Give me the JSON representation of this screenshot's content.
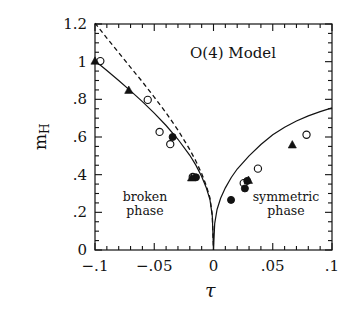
{
  "figure": {
    "title": "O(4) Model",
    "y_axis_label_main": "m",
    "y_axis_label_sub": "H",
    "x_axis_label": "τ",
    "annotations": {
      "left_line1": "broken",
      "left_line2": "phase",
      "right_line1": "symmetric",
      "right_line2": "phase"
    }
  },
  "chart_data": {
    "type": "scatter",
    "title": "O(4) Model",
    "xlabel": "τ",
    "ylabel": "m_H",
    "xlim": [
      -0.1,
      0.1
    ],
    "ylim": [
      0,
      1.2
    ],
    "grid": false,
    "legend": "none",
    "x_major_ticks": [
      -0.1,
      -0.05,
      0,
      0.05,
      0.1
    ],
    "x_major_tick_labels": [
      "−.1",
      "−.05",
      "0",
      ".05",
      ".1"
    ],
    "x_minor_step": 0.01,
    "y_major_ticks": [
      0,
      0.2,
      0.4,
      0.6,
      0.8,
      1.0,
      1.2
    ],
    "y_major_tick_labels": [
      "0",
      ".2",
      ".4",
      ".6",
      ".8",
      "1",
      "1.2"
    ],
    "y_minor_step": 0.05,
    "annotations": [
      {
        "text": "O(4) Model",
        "x": 0.012,
        "y": 1.04
      },
      {
        "text": "broken phase",
        "x": -0.058,
        "y": 0.235
      },
      {
        "text": "symmetric phase",
        "x": 0.055,
        "y": 0.235
      }
    ],
    "series": [
      {
        "name": "solid-curve",
        "style": "line-solid",
        "comment": "V-shaped fit passing through origin; broken branch left, symmetric branch right",
        "x": [
          -0.1,
          -0.09,
          -0.08,
          -0.07,
          -0.06,
          -0.05,
          -0.04,
          -0.03,
          -0.02,
          -0.015,
          -0.01,
          -0.006,
          -0.003,
          -0.001,
          0.0,
          0.001,
          0.003,
          0.006,
          0.01,
          0.015,
          0.02,
          0.03,
          0.04,
          0.05,
          0.06,
          0.07,
          0.08,
          0.09,
          0.1
        ],
        "y": [
          1.005,
          0.953,
          0.9,
          0.845,
          0.788,
          0.727,
          0.661,
          0.588,
          0.503,
          0.452,
          0.39,
          0.329,
          0.268,
          0.18,
          0.0,
          0.14,
          0.215,
          0.275,
          0.33,
          0.385,
          0.43,
          0.5,
          0.56,
          0.612,
          0.652,
          0.685,
          0.712,
          0.735,
          0.755
        ]
      },
      {
        "name": "dashed-curve",
        "style": "line-dashed",
        "comment": "mean-field / perturbative curve, broken phase only",
        "x": [
          -0.1,
          -0.09,
          -0.08,
          -0.07,
          -0.06,
          -0.05,
          -0.04,
          -0.03,
          -0.02,
          -0.015,
          -0.01,
          -0.006,
          -0.003,
          -0.001,
          0.0
        ],
        "y": [
          1.205,
          1.125,
          1.048,
          0.97,
          0.893,
          0.812,
          0.728,
          0.637,
          0.533,
          0.474,
          0.406,
          0.34,
          0.277,
          0.185,
          0.0
        ]
      },
      {
        "name": "open-circles",
        "style": "marker-open-circle",
        "x": [
          -0.0955,
          -0.0555,
          -0.0455,
          -0.0365,
          -0.0175,
          0.0255,
          0.0375,
          0.0785
        ],
        "y": [
          1.003,
          0.797,
          0.627,
          0.562,
          0.388,
          0.355,
          0.432,
          0.612
        ]
      },
      {
        "name": "filled-circles",
        "style": "marker-filled-circle",
        "x": [
          -0.0345,
          -0.0148,
          0.0148,
          0.0265,
          0.0285
        ],
        "y": [
          0.6,
          0.386,
          0.266,
          0.327,
          0.367
        ]
      },
      {
        "name": "filled-triangles",
        "style": "marker-filled-triangle",
        "x": [
          -0.1,
          -0.0715,
          -0.0185,
          0.0295,
          0.0665
        ],
        "y": [
          1.003,
          0.848,
          0.383,
          0.37,
          0.558
        ]
      }
    ]
  }
}
